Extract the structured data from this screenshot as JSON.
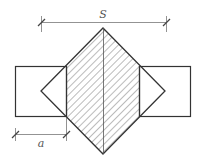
{
  "diagram": {
    "labels": {
      "span": "S",
      "width": "a"
    },
    "colors": {
      "stroke": "#333333",
      "dimension": "#777777",
      "hatch": "#555555",
      "background": "#ffffff"
    }
  }
}
